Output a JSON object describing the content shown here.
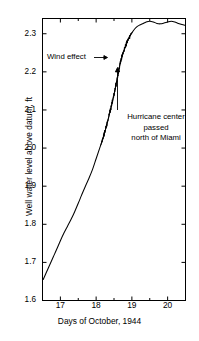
{
  "chart_data": {
    "type": "line",
    "title": "",
    "subtitle": "",
    "xlabel": "Days of October, 1944",
    "ylabel": "Well water level above datum, ft",
    "xlim": [
      16.5,
      20.5
    ],
    "ylim": [
      1.6,
      2.34
    ],
    "xticks": [
      17,
      18,
      19,
      20
    ],
    "xticklabels": [
      "17",
      "18",
      "19",
      "20"
    ],
    "xminorticks": [
      16.5,
      17.5,
      18.5,
      19.5,
      20.5
    ],
    "yticks": [
      1.6,
      1.7,
      1.8,
      1.9,
      2.0,
      2.1,
      2.2,
      2.3
    ],
    "yticklabels": [
      "1.6",
      "1.7",
      "1.8",
      "1.9",
      "2.0",
      "2.1",
      "2.2",
      "2.3"
    ],
    "grid": false,
    "legend": null,
    "series": [
      {
        "name": "Well water level",
        "x": [
          16.52,
          16.6,
          16.7,
          16.8,
          16.9,
          17.0,
          17.1,
          17.2,
          17.3,
          17.4,
          17.5,
          17.6,
          17.7,
          17.8,
          17.9,
          18.0,
          18.1,
          18.2,
          18.3,
          18.4,
          18.5,
          18.58,
          18.65,
          18.72,
          18.8,
          18.88,
          18.96,
          19.04,
          19.12,
          19.2,
          19.3,
          19.4,
          19.5,
          19.6,
          19.7,
          19.8,
          19.9,
          20.0,
          20.1,
          20.2,
          20.3,
          20.4,
          20.5
        ],
        "y": [
          1.655,
          1.672,
          1.693,
          1.714,
          1.735,
          1.757,
          1.777,
          1.795,
          1.813,
          1.833,
          1.855,
          1.878,
          1.9,
          1.921,
          1.944,
          1.972,
          2.0,
          2.028,
          2.062,
          2.1,
          2.14,
          2.178,
          2.212,
          2.24,
          2.262,
          2.281,
          2.296,
          2.308,
          2.317,
          2.322,
          2.326,
          2.331,
          2.333,
          2.331,
          2.327,
          2.326,
          2.328,
          2.331,
          2.333,
          2.331,
          2.327,
          2.324,
          2.322
        ]
      }
    ],
    "annotations": [
      {
        "name": "wind-effect",
        "text": "Wind effect",
        "arrow": "right",
        "points_to_x": 18.62,
        "points_to_y": 2.232
      },
      {
        "name": "hurricane-center",
        "lines": [
          "Hurricane center",
          "passed",
          "north of Miami"
        ],
        "arrow": "up",
        "points_to_x": 18.55,
        "points_to_y": 2.205
      }
    ],
    "noise_band": {
      "description": "high-frequency wind-driven oscillation thickening the trace",
      "x_start": 18.12,
      "x_end": 19.02
    }
  },
  "axis": {
    "x_label": "Days of October, 1944",
    "y_label": "Well water level above datum, ft",
    "y_tick_labels": [
      "2.3",
      "2.2",
      "2.1",
      "2.0",
      "1.9",
      "1.8",
      "1.7",
      "1.6"
    ],
    "x_tick_labels": [
      "17",
      "18",
      "19",
      "20"
    ]
  },
  "annotations": {
    "wind_effect": "Wind effect",
    "hurricane_line1": "Hurricane center",
    "hurricane_line2": "passed",
    "hurricane_line3": "north of Miami"
  },
  "style": {
    "line_color": "#000000",
    "frame_color": "#000000",
    "background": "#ffffff"
  }
}
